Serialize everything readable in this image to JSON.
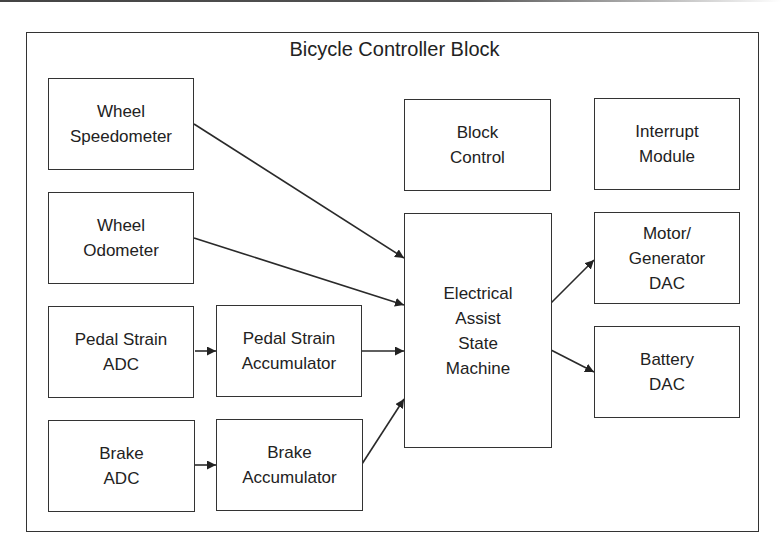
{
  "diagram": {
    "title": "Bicycle Controller Block",
    "blocks": [
      {
        "id": "wheel-speedometer",
        "label": "Wheel\nSpeedometer"
      },
      {
        "id": "wheel-odometer",
        "label": "Wheel\nOdometer"
      },
      {
        "id": "pedal-strain-adc",
        "label": "Pedal Strain\nADC"
      },
      {
        "id": "pedal-strain-accumulator",
        "label": "Pedal Strain\nAccumulator"
      },
      {
        "id": "brake-adc",
        "label": "Brake\nADC"
      },
      {
        "id": "brake-accumulator",
        "label": "Brake\nAccumulator"
      },
      {
        "id": "block-control",
        "label": "Block\nControl"
      },
      {
        "id": "electrical-assist-state-machine",
        "label": "Electrical\nAssist\nState\nMachine"
      },
      {
        "id": "interrupt-module",
        "label": "Interrupt\nModule"
      },
      {
        "id": "motor-generator-dac",
        "label": "Motor/\nGenerator\nDAC"
      },
      {
        "id": "battery-dac",
        "label": "Battery\nDAC"
      }
    ],
    "connections": [
      {
        "from": "Wheel Speedometer",
        "to": "Electrical Assist State Machine"
      },
      {
        "from": "Wheel Odometer",
        "to": "Electrical Assist State Machine"
      },
      {
        "from": "Pedal Strain ADC",
        "to": "Pedal Strain Accumulator"
      },
      {
        "from": "Pedal Strain Accumulator",
        "to": "Electrical Assist State Machine"
      },
      {
        "from": "Brake ADC",
        "to": "Brake Accumulator"
      },
      {
        "from": "Brake Accumulator",
        "to": "Electrical Assist State Machine"
      },
      {
        "from": "Electrical Assist State Machine",
        "to": "Motor/Generator DAC"
      },
      {
        "from": "Electrical Assist State Machine",
        "to": "Battery DAC"
      }
    ],
    "colors": {
      "stroke": "#333333",
      "text": "#222222",
      "background": "#ffffff"
    }
  }
}
